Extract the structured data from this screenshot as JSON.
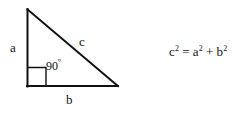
{
  "figure": {
    "type": "geometry-diagram",
    "background_color": "#ffffff",
    "stroke_color": "#111111",
    "stroke_width": 2,
    "triangle": {
      "shape": "right-triangle",
      "vertices": {
        "apex": {
          "x": 27,
          "y": 9
        },
        "bottom_left": {
          "x": 27,
          "y": 86
        },
        "bottom_right": {
          "x": 118,
          "y": 86
        }
      },
      "sides": [
        {
          "name": "vertical-leg",
          "label": "a",
          "from": "apex",
          "to": "bottom_left"
        },
        {
          "name": "horizontal-leg",
          "label": "b",
          "from": "bottom_left",
          "to": "bottom_right"
        },
        {
          "name": "hypotenuse",
          "label": "c",
          "from": "apex",
          "to": "bottom_right"
        }
      ],
      "right_angle_marker": {
        "at_vertex": "bottom_left",
        "size": 18,
        "stroke_width": 1
      }
    },
    "labels": {
      "leg_a": "a",
      "leg_b": "b",
      "hypotenuse_c": "c",
      "right_angle_value": "90",
      "degree_symbol": "º"
    },
    "equation": {
      "full_text": "c² = a² + b²",
      "left_base": "c",
      "left_exponent": "2",
      "equals": "=",
      "term1_base": "a",
      "term1_exponent": "2",
      "plus": "+",
      "term2_base": "b",
      "term2_exponent": "2"
    }
  }
}
